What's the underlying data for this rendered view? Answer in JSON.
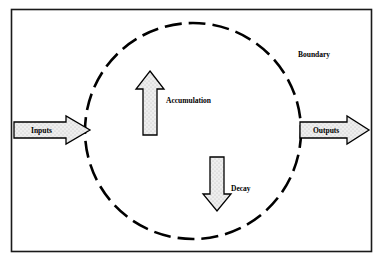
{
  "diagram": {
    "frame": {
      "name": "outer-border",
      "x": 11,
      "y": 9,
      "width": 361,
      "height": 243,
      "stroke": "#1a1a1a",
      "fill": "#ffffff"
    },
    "boundary_circle": {
      "label": "Boundary",
      "cx": 193,
      "cy": 131,
      "r": 108,
      "stroke": "#000000",
      "dash_pattern": "17 7",
      "label_x": 298,
      "label_y": 57
    },
    "flows": [
      {
        "name": "inputs-arrow",
        "label": "Inputs",
        "direction": "right",
        "x": 14,
        "y": 117,
        "width": 76,
        "height": 26,
        "label_x": 45,
        "label_y": 134
      },
      {
        "name": "outputs-arrow",
        "label": "Outputs",
        "direction": "right",
        "x": 300,
        "y": 117,
        "width": 68,
        "height": 26,
        "label_x": 314,
        "label_y": 134
      },
      {
        "name": "accumulation-arrow",
        "label": "Accumulation",
        "direction": "up",
        "x": 137,
        "y": 72,
        "width": 26,
        "height": 63,
        "label_x": 165,
        "label_y": 103
      },
      {
        "name": "decay-arrow",
        "label": "Decay",
        "direction": "down",
        "x": 205,
        "y": 157,
        "width": 24,
        "height": 54,
        "label_x": 231,
        "label_y": 191
      }
    ],
    "colors": {
      "line": "#000000",
      "arrow_fill": "#ebebeb",
      "background": "#ffffff",
      "frame_stroke": "#1a1a1a"
    }
  }
}
